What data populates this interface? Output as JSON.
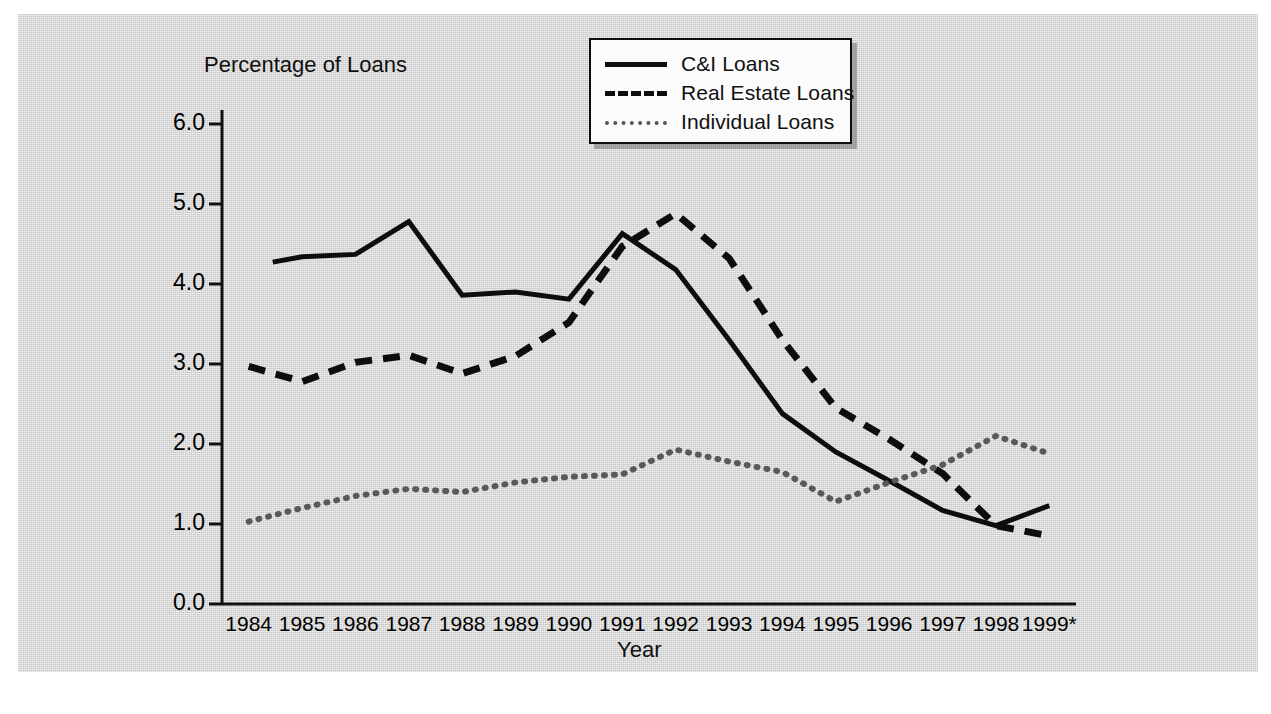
{
  "figure": {
    "background_color": "#d4d4d4",
    "page_color": "#ffffff"
  },
  "chart_data": {
    "type": "line",
    "title": "",
    "ylabel": "Percentage of Loans",
    "xlabel": "Year",
    "ylim": [
      0.0,
      6.5
    ],
    "ytick_labels": [
      "0.0",
      "1.0",
      "2.0",
      "3.0",
      "4.0",
      "5.0",
      "6.0"
    ],
    "ytick_values": [
      0.0,
      1.0,
      2.0,
      3.0,
      4.0,
      5.0,
      6.0
    ],
    "grid": false,
    "legend_position": "top-center",
    "categories": [
      "1984",
      "1985",
      "1986",
      "1987",
      "1988",
      "1989",
      "1990",
      "1991",
      "1992",
      "1993",
      "1994",
      "1995",
      "1996",
      "1997",
      "1998",
      "1999*"
    ],
    "x": [
      1984,
      1985,
      1986,
      1987,
      1988,
      1989,
      1990,
      1991,
      1992,
      1993,
      1994,
      1995,
      1996,
      1997,
      1998,
      1999
    ],
    "series": [
      {
        "name": "C&I Loans",
        "style": "solid",
        "color": "#0d0d0d",
        "values": [
          4.22,
          4.34,
          4.37,
          4.78,
          3.86,
          3.9,
          3.81,
          4.63,
          4.18,
          3.3,
          2.38,
          1.9,
          1.54,
          1.17,
          0.98,
          1.23
        ],
        "start_offset": 0.45
      },
      {
        "name": "Real Estate Loans",
        "style": "dashed",
        "color": "#0d0d0d",
        "values": [
          2.97,
          2.78,
          3.02,
          3.11,
          2.88,
          3.1,
          3.52,
          4.47,
          4.88,
          4.32,
          3.3,
          2.45,
          2.06,
          1.63,
          0.98,
          0.85
        ]
      },
      {
        "name": "Individual Loans",
        "style": "dotted",
        "color": "#595959",
        "values": [
          1.03,
          1.2,
          1.35,
          1.44,
          1.4,
          1.52,
          1.59,
          1.62,
          1.93,
          1.78,
          1.65,
          1.28,
          1.52,
          1.74,
          2.1,
          1.88
        ]
      }
    ]
  },
  "legend": {
    "items": [
      {
        "label": "C&I Loans",
        "style": "solid"
      },
      {
        "label": "Real Estate Loans",
        "style": "dashed"
      },
      {
        "label": "Individual Loans",
        "style": "dotted"
      }
    ]
  },
  "footnote": {
    "marker": "*"
  }
}
